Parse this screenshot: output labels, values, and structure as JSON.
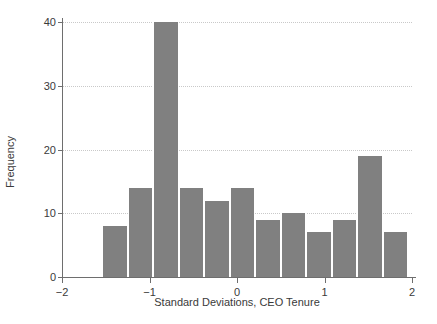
{
  "chart_data": {
    "type": "bar",
    "title": "",
    "subtitle": "",
    "xlabel": "Standard Deviations, CEO Tenure",
    "ylabel": "Frequency",
    "xlim": [
      -2,
      2
    ],
    "ylim": [
      0,
      40
    ],
    "grid": true,
    "legend": null,
    "bar_color": "#808080",
    "bar_edge_color": "#ffffff",
    "xticks": [
      -2,
      -1,
      0,
      1,
      2
    ],
    "xtick_labels": [
      "−2",
      "−1",
      "0",
      "1",
      "2"
    ],
    "yticks": [
      0,
      10,
      20,
      30,
      40
    ],
    "ytick_labels": [
      "0",
      "10",
      "20",
      "30",
      "40"
    ],
    "bin_edges": [
      -1.5417,
      -1.25,
      -0.9583,
      -0.6667,
      -0.375,
      -0.0833,
      0.2083,
      0.5,
      0.7917,
      1.0833,
      1.375,
      1.6667,
      1.9583
    ],
    "bins": [
      {
        "x0": -1.5417,
        "x1": -1.25,
        "value": 8
      },
      {
        "x0": -1.25,
        "x1": -0.9583,
        "value": 14
      },
      {
        "x0": -0.9583,
        "x1": -0.6667,
        "value": 40
      },
      {
        "x0": -0.6667,
        "x1": -0.375,
        "value": 14
      },
      {
        "x0": -0.375,
        "x1": -0.0833,
        "value": 12
      },
      {
        "x0": -0.0833,
        "x1": 0.2083,
        "value": 14
      },
      {
        "x0": 0.2083,
        "x1": 0.5,
        "value": 9
      },
      {
        "x0": 0.5,
        "x1": 0.7917,
        "value": 10
      },
      {
        "x0": 0.7917,
        "x1": 1.0833,
        "value": 7
      },
      {
        "x0": 1.0833,
        "x1": 1.375,
        "value": 9
      },
      {
        "x0": 1.375,
        "x1": 1.6667,
        "value": 19
      },
      {
        "x0": 1.6667,
        "x1": 1.9583,
        "value": 7
      }
    ],
    "values": [
      8,
      14,
      40,
      14,
      12,
      14,
      9,
      10,
      7,
      9,
      19,
      7
    ],
    "categories": [
      "-1.54–-1.25",
      "-1.25–-0.96",
      "-0.96–-0.67",
      "-0.67–-0.38",
      "-0.38–-0.08",
      "-0.08–0.21",
      "0.21–0.50",
      "0.50–0.79",
      "0.79–1.08",
      "1.08–1.38",
      "1.38–1.67",
      "1.67–1.96"
    ]
  }
}
